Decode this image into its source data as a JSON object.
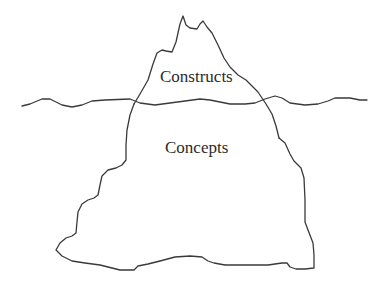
{
  "diagram": {
    "type": "iceberg",
    "labels": {
      "above_water": "Constructs",
      "below_water": "Concepts"
    },
    "colors": {
      "stroke": "#3a3a3a",
      "text": "#2b2b2b",
      "background": "#ffffff"
    }
  }
}
